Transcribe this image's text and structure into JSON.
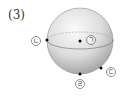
{
  "problem": {
    "number": "(3)"
  },
  "sphere": {
    "center": [
      80,
      41
    ],
    "radius": 33,
    "fill_light": "#f6f6f6",
    "fill_dark": "#9a9a9a",
    "outline": "#888888"
  },
  "points": [
    {
      "id": "giyeok",
      "label": "ㄱ",
      "dot": [
        80,
        41
      ],
      "label_pos": [
        91,
        40
      ]
    },
    {
      "id": "nieun",
      "label": "ㄴ",
      "dot": [
        47,
        40
      ],
      "label_pos": [
        36,
        41
      ]
    },
    {
      "id": "digeut",
      "label": "ㄷ",
      "dot": [
        101,
        68
      ],
      "label_pos": [
        111,
        72
      ]
    },
    {
      "id": "rieul",
      "label": "ㄹ",
      "dot": [
        80,
        74
      ],
      "label_pos": [
        80,
        84
      ]
    }
  ]
}
